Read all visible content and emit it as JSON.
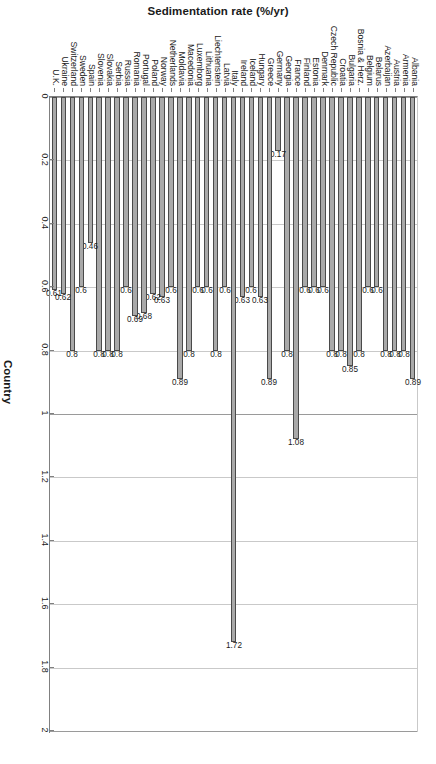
{
  "chart_data": {
    "type": "bar",
    "orientation": "vertical",
    "title": "",
    "xlabel": "Country",
    "ylabel": "Sedimentation rate (%/yr)",
    "ylim": [
      0,
      2
    ],
    "yticks": [
      "0",
      "0.2",
      "0.4",
      "0.6",
      "0.8",
      "1",
      "1.2",
      "1.4",
      "1.6",
      "1.8",
      "2"
    ],
    "ytick_values": [
      0,
      0.2,
      0.4,
      0.6,
      0.8,
      1,
      1.2,
      1.4,
      1.6,
      1.8,
      2
    ],
    "grid": true,
    "legend": false,
    "bar_color": "#a9a9a9",
    "bar_border_color": "#4a4a4a",
    "categories": [
      "Albania",
      "Armenia",
      "Austria",
      "Azerbaijan",
      "Belarus",
      "Belgium",
      "Bosnia & Herz.",
      "Bulgaria",
      "Croatia",
      "Czech Republic",
      "Denmark",
      "Estonia",
      "Finland",
      "France",
      "Georgia",
      "Germany",
      "Greece",
      "Hungary",
      "Iceland",
      "Ireland",
      "Italy",
      "Latvia",
      "Liechtenstein",
      "Lithuania",
      "Luxemborg",
      "Macedonia",
      "Moldavia",
      "Netherlands",
      "Norway",
      "Poland",
      "Portugal",
      "Romania",
      "Russia",
      "Serbia",
      "Slovakia",
      "Slovenia",
      "Spain",
      "Sweden",
      "Switzerland",
      "Ukraine",
      "U.K."
    ],
    "values": [
      0.89,
      0.8,
      0.8,
      0.8,
      0.6,
      0.6,
      0.8,
      0.85,
      0.8,
      0.8,
      0.6,
      0.6,
      0.6,
      1.08,
      0.8,
      0.17,
      0.89,
      0.63,
      0.6,
      0.63,
      1.72,
      0.6,
      0.8,
      0.6,
      0.6,
      0.8,
      0.89,
      0.6,
      0.63,
      0.62,
      0.68,
      0.69,
      0.6,
      0.8,
      0.8,
      0.8,
      0.46,
      0.6,
      0.8,
      0.62,
      0.61
    ],
    "value_labels": [
      "0.89",
      "0.8",
      "0.8",
      "0.8",
      "0.6",
      "0.6",
      "0.8",
      "0.85",
      "0.8",
      "0.8",
      "0.6",
      "0.6",
      "0.6",
      "1.08",
      "0.8",
      "0.17",
      "0.89",
      "0.63",
      "0.6",
      "0.63",
      "1.72",
      "0.6",
      "0.8",
      "0.6",
      "0.6",
      "0.8",
      "0.89",
      "0.6",
      "0.63",
      "0.62",
      "0.68",
      "0.69",
      "0.6",
      "0.8",
      "0.8",
      "0.8",
      "0.46",
      "0.6",
      "0.8",
      "0.62",
      "0.61"
    ]
  }
}
